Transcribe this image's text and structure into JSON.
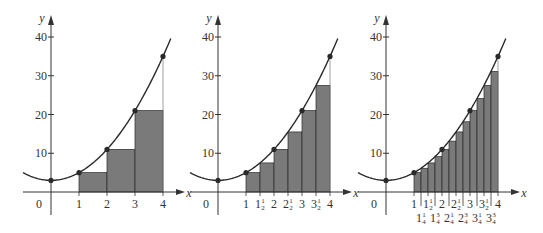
{
  "chart_data": [
    {
      "type": "bar",
      "title": "",
      "function": "y = 2x^2 + 3",
      "curve_points": {
        "x": [
          0,
          1,
          2,
          3,
          4
        ],
        "y": [
          3,
          5,
          11,
          21,
          35
        ]
      },
      "xlabel": "x",
      "ylabel": "y",
      "xlim": [
        -1,
        4.6
      ],
      "ylim": [
        0,
        42
      ],
      "yticks": [
        10,
        20,
        30,
        40
      ],
      "xtick_labels": [
        "0",
        "1",
        "2",
        "3",
        "4"
      ],
      "rectangle_width": 1,
      "categories": [
        "1",
        "2",
        "3"
      ],
      "values": [
        5,
        11,
        21
      ],
      "grid": false
    },
    {
      "type": "bar",
      "title": "",
      "function": "y = 2x^2 + 3",
      "curve_points": {
        "x": [
          0,
          1,
          2,
          3,
          4
        ],
        "y": [
          3,
          5,
          11,
          21,
          35
        ]
      },
      "xlabel": "x",
      "ylabel": "y",
      "xlim": [
        -1,
        4.6
      ],
      "ylim": [
        0,
        42
      ],
      "yticks": [
        10,
        20,
        30,
        40
      ],
      "xtick_labels": [
        "0",
        "1",
        "1½",
        "2",
        "2½",
        "3",
        "3½",
        "4"
      ],
      "rectangle_width": 0.5,
      "categories": [
        "1",
        "1½",
        "2",
        "2½",
        "3",
        "3½"
      ],
      "values": [
        5,
        7.5,
        11,
        15.5,
        21,
        27.5
      ],
      "grid": false
    },
    {
      "type": "bar",
      "title": "",
      "function": "y = 2x^2 + 3",
      "curve_points": {
        "x": [
          0,
          1,
          2,
          3,
          4
        ],
        "y": [
          3,
          5,
          11,
          21,
          35
        ]
      },
      "xlabel": "x",
      "ylabel": "y",
      "xlim": [
        -1,
        4.6
      ],
      "ylim": [
        0,
        42
      ],
      "yticks": [
        10,
        20,
        30,
        40
      ],
      "xtick_labels": [
        "0",
        "1",
        "1¼",
        "1½",
        "1¾",
        "2",
        "2¼",
        "2½",
        "2¾",
        "3",
        "3¼",
        "3½",
        "3¾",
        "4"
      ],
      "rectangle_width": 0.25,
      "categories": [
        "1",
        "1¼",
        "1½",
        "1¾",
        "2",
        "2¼",
        "2½",
        "2¾",
        "3",
        "3¼",
        "3½",
        "3¾"
      ],
      "values": [
        5,
        6.125,
        7.5,
        9.125,
        11,
        13.125,
        15.5,
        18.125,
        21,
        24.125,
        27.5,
        31.125
      ],
      "grid": false
    }
  ],
  "panels": [
    {
      "origin_label": "0",
      "x_axis_label": "x",
      "y_axis_label": "y",
      "y_tick_labels": [
        "10",
        "20",
        "30",
        "40"
      ],
      "x_ticks_upper": [
        {
          "v": 1,
          "t": "1"
        },
        {
          "v": 2,
          "t": "2"
        },
        {
          "v": 3,
          "t": "3"
        },
        {
          "v": 4,
          "t": "4"
        }
      ],
      "x_ticks_lower": []
    },
    {
      "origin_label": "0",
      "x_axis_label": "x",
      "y_axis_label": "y",
      "y_tick_labels": [
        "10",
        "20",
        "30",
        "40"
      ],
      "x_ticks_upper": [
        {
          "v": 1,
          "t": "1"
        },
        {
          "v": 1.5,
          "t": "1",
          "f": "1/2"
        },
        {
          "v": 2,
          "t": "2"
        },
        {
          "v": 2.5,
          "t": "2",
          "f": "1/2"
        },
        {
          "v": 3,
          "t": "3"
        },
        {
          "v": 3.5,
          "t": "3",
          "f": "1/2"
        },
        {
          "v": 4,
          "t": "4"
        }
      ],
      "x_ticks_lower": []
    },
    {
      "origin_label": "0",
      "x_axis_label": "x",
      "y_axis_label": "y",
      "y_tick_labels": [
        "10",
        "20",
        "30",
        "40"
      ],
      "x_ticks_upper": [
        {
          "v": 1,
          "t": "1"
        },
        {
          "v": 1.5,
          "t": "1",
          "f": "1/2"
        },
        {
          "v": 2,
          "t": "2"
        },
        {
          "v": 2.5,
          "t": "2",
          "f": "1/2"
        },
        {
          "v": 3,
          "t": "3"
        },
        {
          "v": 3.5,
          "t": "3",
          "f": "1/2"
        },
        {
          "v": 4,
          "t": "4"
        }
      ],
      "x_ticks_lower": [
        {
          "v": 1.25,
          "t": "1",
          "f": "1/4"
        },
        {
          "v": 1.75,
          "t": "1",
          "f": "3/4"
        },
        {
          "v": 2.25,
          "t": "2",
          "f": "1/4"
        },
        {
          "v": 2.75,
          "t": "2",
          "f": "3/4"
        },
        {
          "v": 3.25,
          "t": "3",
          "f": "1/4"
        },
        {
          "v": 3.75,
          "t": "3",
          "f": "3/4"
        }
      ]
    }
  ],
  "colors": {
    "bar_fill": "#7a7a7a",
    "bar_stroke": "#2a2a2a",
    "curve": "#2a2a2a",
    "axis": "#333333",
    "point": "#2a2a2a",
    "background": "#ffffff"
  }
}
